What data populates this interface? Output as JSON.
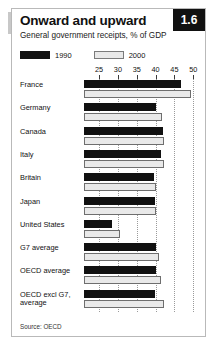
{
  "figure": {
    "number_badge": "1.6",
    "title": "Onward and upward",
    "subtitle": "General government receipts, % of GDP",
    "source": "Source: OECD",
    "colors": {
      "series_1990": "#111111",
      "series_2000": "#e9e9e9",
      "series_2000_border": "#6e6e6e",
      "badge_bg": "#111111",
      "badge_text": "#ffffff",
      "frame_border": "#b9b9b9",
      "gridline": "#9a9a9a"
    }
  },
  "legend": {
    "position": "top-left",
    "items": [
      {
        "label": "1990",
        "swatch": "black-swatch"
      },
      {
        "label": "2000",
        "swatch": "grey-swatch"
      }
    ]
  },
  "chart_data": {
    "type": "bar",
    "orientation": "horizontal",
    "title": "Onward and upward",
    "subtitle": "General government receipts, % of GDP",
    "xlabel": "",
    "ylabel": "",
    "xlim": [
      21,
      51
    ],
    "ticks": [
      25,
      30,
      35,
      40,
      45,
      50
    ],
    "grid": true,
    "legend": [
      "1990",
      "2000"
    ],
    "categories": [
      "France",
      "Germany",
      "Canada",
      "Italy",
      "Britain",
      "Japan",
      "United States",
      "G7 average",
      "OECD average",
      "OECD excl G7, average"
    ],
    "series": [
      {
        "name": "1990",
        "values": [
          46.8,
          40.0,
          42.0,
          41.5,
          39.5,
          39.8,
          28.5,
          40.0,
          40.2,
          39.8
        ]
      },
      {
        "name": "2000",
        "values": [
          49.5,
          41.8,
          42.2,
          42.3,
          40.0,
          40.0,
          30.5,
          41.0,
          41.5,
          42.2
        ]
      }
    ],
    "source": "Source: OECD"
  }
}
